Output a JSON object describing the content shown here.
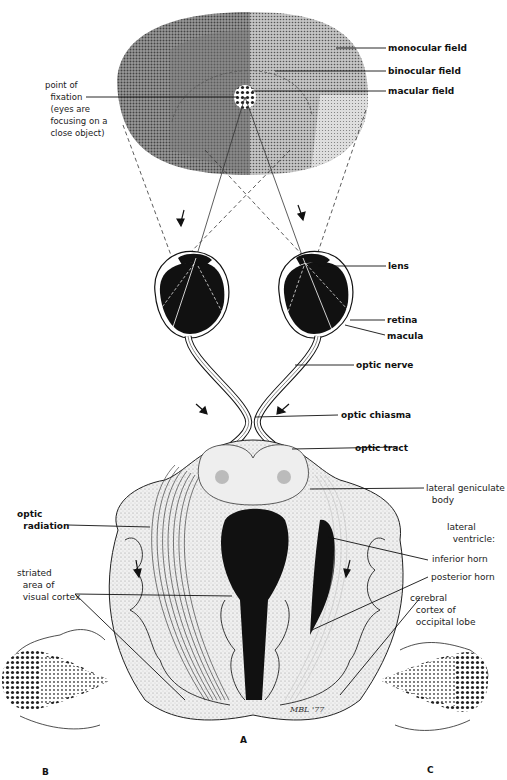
{
  "diagram": {
    "panels": [
      {
        "id": "A",
        "label": "A"
      },
      {
        "id": "B",
        "label": "B"
      },
      {
        "id": "C",
        "label": "C"
      }
    ],
    "signature": "MBL '77"
  },
  "labels": {
    "monocular_field": "monocular field",
    "binocular_field": "binocular field",
    "macular_field": "macular field",
    "point_of_fixation": "point of\n  fixation\n  (eyes are\n  focusing on a\n  close object)",
    "lens": "lens",
    "retina": "retina",
    "macula": "macula",
    "optic_nerve": "optic nerve",
    "optic_chiasma": "optic chiasma",
    "optic_tract": "optic tract",
    "lateral_geniculate_body": "lateral geniculate\n  body",
    "optic_radiation": "optic\n  radiation",
    "lateral_ventricle": "lateral\n  ventricle:",
    "inferior_horn": "inferior horn",
    "posterior_horn": "posterior horn",
    "striated_area": "striated\n  area of\n  visual cortex",
    "cerebral_cortex": "cerebral\n  cortex of\n  occipital lobe"
  },
  "colors": {
    "ink": "#111111",
    "field_dark": "#6a6a6a",
    "field_mid": "#8c8c8c",
    "field_light": "#b8b8b8",
    "brain_fill": "#e4e4e4",
    "background": "#ffffff"
  }
}
